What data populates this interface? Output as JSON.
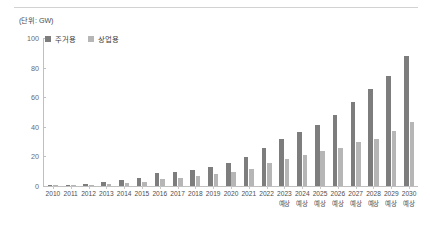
{
  "unit_label": "(단위: GW)",
  "legend": {
    "items": [
      {
        "label": "주거용",
        "color": "#7d7d7d",
        "swatch_name": "legend-swatch-residential"
      },
      {
        "label": "상업용",
        "color": "#b6b6b6",
        "swatch_name": "legend-swatch-commercial"
      }
    ]
  },
  "forecast_note": "예상",
  "chart_data": {
    "type": "bar",
    "title": "",
    "subtitle": "",
    "xlabel": "",
    "ylabel": "",
    "unit": "GW",
    "ylim": [
      0,
      100
    ],
    "yticks": [
      0,
      20,
      40,
      60,
      80,
      100
    ],
    "grid": false,
    "legend_position": "top-left",
    "categories": [
      "2010",
      "2011",
      "2012",
      "2013",
      "2014",
      "2015",
      "2016",
      "2017",
      "2018",
      "2019",
      "2020",
      "2021",
      "2022",
      "2023",
      "2024",
      "2025",
      "2026",
      "2027",
      "2028",
      "2029",
      "2030"
    ],
    "forecast_categories": [
      "2023",
      "2024",
      "2025",
      "2026",
      "2027",
      "2028",
      "2029",
      "2030"
    ],
    "series": [
      {
        "name": "주거용",
        "color": "#7d7d7d",
        "values": [
          0.6,
          0.8,
          1.2,
          2.4,
          4.0,
          5.5,
          8.5,
          9.5,
          11.0,
          13.0,
          15.5,
          19.5,
          26.0,
          31.5,
          36.5,
          41.0,
          48.0,
          57.0,
          65.5,
          74.5,
          88.0
        ]
      },
      {
        "name": "상업용",
        "color": "#b6b6b6",
        "values": [
          0.3,
          0.4,
          0.7,
          1.2,
          2.0,
          3.0,
          4.5,
          5.5,
          6.5,
          8.0,
          9.5,
          11.5,
          15.5,
          18.5,
          21.0,
          23.5,
          25.5,
          29.5,
          32.0,
          37.5,
          43.0
        ]
      }
    ]
  }
}
